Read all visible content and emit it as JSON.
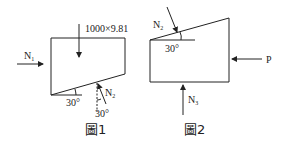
{
  "figures": [
    {
      "caption": "圖1",
      "weight_label": "1000×9.81",
      "force_left": {
        "symbol": "N",
        "sub": "1"
      },
      "force_incline": {
        "symbol": "N",
        "sub": "2"
      },
      "angle_incline": "30°",
      "angle_force": "30°"
    },
    {
      "caption": "圖2",
      "force_top": {
        "symbol": "N",
        "sub": "2"
      },
      "force_bottom": {
        "symbol": "N",
        "sub": "3"
      },
      "force_right": "P",
      "angle_incline": "30°"
    }
  ],
  "colors": {
    "stroke": "#222222",
    "background": "#ffffff"
  }
}
